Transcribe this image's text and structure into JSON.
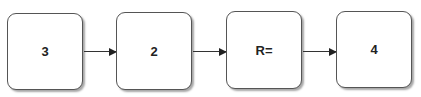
{
  "diagram": {
    "type": "flowchart",
    "direction": "left-to-right",
    "nodes": [
      {
        "id": "n1",
        "label": "3"
      },
      {
        "id": "n2",
        "label": "2"
      },
      {
        "id": "n3",
        "label": "R="
      },
      {
        "id": "n4",
        "label": "4"
      }
    ],
    "edges": [
      {
        "from": "n1",
        "to": "n2"
      },
      {
        "from": "n2",
        "to": "n3"
      },
      {
        "from": "n3",
        "to": "n4"
      }
    ],
    "colors": {
      "border": "#555555",
      "fill": "#ffffff",
      "arrow": "#333333",
      "text": "#222222"
    }
  }
}
